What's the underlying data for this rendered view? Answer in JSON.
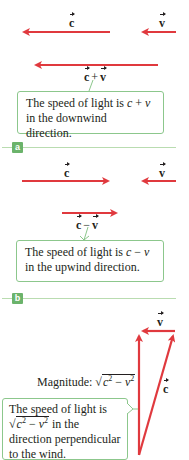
{
  "colors": {
    "arrow": "#e0393e",
    "callout_border": "#8cc78c",
    "tag_bg": "#6bb36b",
    "rule": "#b9dcb0"
  },
  "panel_a": {
    "tag": "a",
    "vec_c": "c",
    "vec_v": "v",
    "sum_left": "c",
    "sum_op": "+",
    "sum_right": "v",
    "callout_pre": "The speed of light is ",
    "callout_math_c": "c",
    "callout_op": " + ",
    "callout_math_v": "v",
    "callout_post": " in the downwind direction."
  },
  "panel_b": {
    "tag": "b",
    "vec_c": "c",
    "vec_v": "v",
    "diff_left": "c",
    "diff_op": "−",
    "diff_right": "v",
    "callout_pre": "The speed of light is ",
    "callout_math_c": "c",
    "callout_op": " − ",
    "callout_math_v": "v",
    "callout_post": " in the upwind direction."
  },
  "panel_c": {
    "vec_v": "v",
    "vec_c": "c",
    "magnitude_label": "Magnitude: ",
    "magnitude_expr_c": "c",
    "magnitude_expr_op": " − ",
    "magnitude_expr_v": "v",
    "exp": "2",
    "callout_line1": "The speed of light is",
    "callout_sqrt_c": "c",
    "callout_sqrt_op": " − ",
    "callout_sqrt_v": "v",
    "callout_after_sqrt": " in the",
    "callout_line3": "direction perpendicular",
    "callout_line4": "to the wind."
  }
}
